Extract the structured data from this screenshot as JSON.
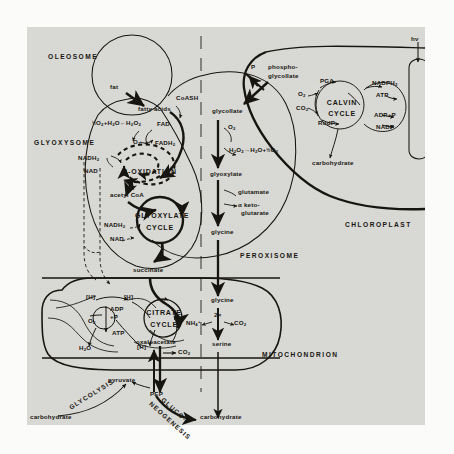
{
  "figure": {
    "type": "diagram",
    "background": "#d9d9d6",
    "ink": "#17150f"
  },
  "organelles": [
    {
      "id": "oleosome",
      "label": "OLEOSOME"
    },
    {
      "id": "glyoxysome",
      "label": "GLYOXYSOME"
    },
    {
      "id": "peroxisome",
      "label": "PEROXISOME"
    },
    {
      "id": "chloroplast",
      "label": "CHLOROPLAST"
    },
    {
      "id": "mitochondrion",
      "label": "MITOCHONDRION"
    }
  ],
  "cycles": [
    {
      "id": "glyoxylate-cycle",
      "line1": "GLYOXYLATE",
      "line2": "CYCLE"
    },
    {
      "id": "citrate-cycle",
      "line1": "CITRATE",
      "line2": "CYCLE"
    },
    {
      "id": "calvin-cycle",
      "line1": "CALVIN",
      "line2": "CYCLE"
    },
    {
      "id": "beta-oxidation",
      "line1": "β-OXIDATION",
      "line2": ""
    }
  ],
  "pathway_labels": [
    {
      "id": "glycolysis",
      "text": "GLYCOLYSIS"
    },
    {
      "id": "gluconeogenesis",
      "line1": "GLUCO-",
      "line2": "NEOGENESIS"
    }
  ],
  "metabolites": {
    "fat": "fat",
    "fatty_acids": "fatty acids",
    "coash": "CoASH",
    "fad": "FAD",
    "fadh2": "FADH",
    "fadh2_sub": "2",
    "o2": "O",
    "o2_sub": "2",
    "h2o2": "H",
    "acetyl_coa": "acetyl CoA",
    "nadh2_a": "NADH",
    "nadh2_a_sub": "2",
    "nad_a": "NAD",
    "nadh2_b": "NADH",
    "nadh2_b_sub": "2",
    "nad_b": "NAD",
    "succinate": "succinate",
    "oxaloacetate": "oxaloacetate",
    "pyruvate": "pyruvate",
    "pep": "PEP",
    "carbohydrate_left": "carbohydrate",
    "carbohydrate_bottom": "carbohydrate",
    "carbohydrate_chloro": "carbohydrate",
    "adp_p_mito_1": "ADP",
    "adp_p_mito_2": "+P",
    "atp_mito": "ATP",
    "h2o_mito": "H",
    "h_bracket": "[H]",
    "co2_mito": "CO",
    "glycollate": "glycollate",
    "glyoxylate": "glyoxylate",
    "glycine_perox": "glycine",
    "glycine_mito": "glycine",
    "serine": "serine",
    "glutamate": "glutamate",
    "keto_glutarate_1": "α keto-",
    "keto_glutarate_2": "glutarate",
    "nh4": "NH",
    "two_x": "2×",
    "phospho_1": "phospho-",
    "phospho_2": "glycollate",
    "p_label": "P",
    "pga": "PGA",
    "rudp": "RudP",
    "nadph": "NADPH",
    "atp_chloro": "ATP",
    "adp_p_chloro": "ADP+P",
    "nadp": "NADP",
    "hv": "hν",
    "co2_calvin": "CO",
    "o2_calvin": "O"
  },
  "reactions": [
    {
      "id": "photorespiration-o2-uptake",
      "text": "½O₂+H₂O←H₂O₂"
    },
    {
      "id": "catalase-peroxisome",
      "text": "H₂O₂→H₂O+½O₂"
    }
  ],
  "icons": {
    "arrow": "arrow-icon",
    "membrane": "membrane-icon",
    "dashed-divider": "dashed-divider-icon",
    "thylakoid": "thylakoid-icon",
    "photon": "photon-arrow-icon"
  }
}
